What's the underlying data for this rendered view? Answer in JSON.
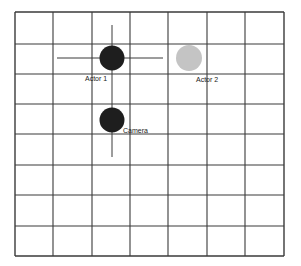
{
  "diagram": {
    "type": "camera-blocking-grid",
    "grid": {
      "columns": 7,
      "rows": 8,
      "x_lines": [
        15,
        53,
        92,
        130,
        168,
        207,
        245,
        284
      ],
      "y_lines": [
        12,
        44,
        74,
        104,
        134,
        165,
        195,
        226,
        256
      ],
      "line_color": "#3a3a3a"
    },
    "crosshair_actor1": {
      "horizontal": {
        "x1": 57,
        "x2": 163,
        "y": 58
      },
      "vertical": {
        "x": 112,
        "y1": 25,
        "y2": 157
      },
      "color": "#3a3a3a"
    },
    "nodes": [
      {
        "id": "actor1",
        "label": "Actor 1",
        "cx": 112,
        "cy": 58,
        "r": 12.5,
        "color": "#1e1e1e",
        "label_x": 85,
        "label_y": 81
      },
      {
        "id": "actor2",
        "label": "Actor 2",
        "cx": 189,
        "cy": 58,
        "r": 13,
        "color": "#c4c4c4",
        "label_x": 196,
        "label_y": 82
      },
      {
        "id": "camera",
        "label": "Camera",
        "cx": 112,
        "cy": 120,
        "r": 12.5,
        "color": "#1e1e1e",
        "label_x": 123,
        "label_y": 133
      }
    ]
  }
}
